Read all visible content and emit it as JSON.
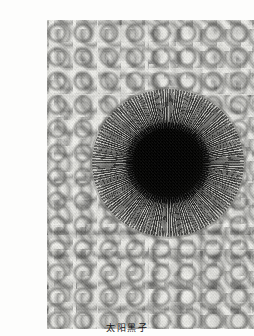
{
  "page": {
    "background_color": "#fdfdfc",
    "width": 254,
    "height": 336
  },
  "figure": {
    "name": "sunspot-photograph",
    "kind": "grayscale astronomical photograph",
    "frame": {
      "x": 7,
      "y": 4,
      "width": 240,
      "height": 309
    },
    "border_color": "#8d8d8b",
    "features": {
      "background_texture": "solar granulation",
      "granule_highlight_color": "#e4e4e0",
      "intergranular_lane_color": "#3a3a38",
      "mid_tone_color": "#8d8d8b",
      "umbra_color": "#050504",
      "penumbra_color": "#3c3c39"
    },
    "sunspot": {
      "center_x": 128,
      "center_y": 147,
      "umbra_radius": 34,
      "penumbra_radius": 76,
      "penumbra_structure": "radial filaments"
    }
  },
  "caption": {
    "text": "太阳黑子",
    "note_clipped_at_bottom": true
  }
}
